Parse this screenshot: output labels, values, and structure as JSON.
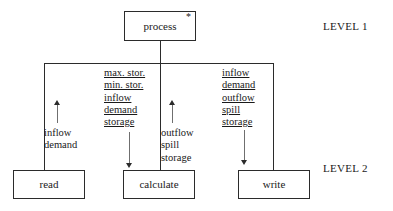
{
  "diagram": {
    "levels": [
      {
        "id": "level-1",
        "label": "LEVEL 1"
      },
      {
        "id": "level-2",
        "label": "LEVEL 2"
      }
    ],
    "modules": {
      "process": {
        "label": "process",
        "annotation": "*"
      },
      "read": {
        "label": "read"
      },
      "calculate": {
        "label": "calculate"
      },
      "write": {
        "label": "write"
      }
    },
    "flows": {
      "read_to_process": {
        "direction": "up",
        "underlined": false,
        "items": [
          "inflow",
          "demand"
        ]
      },
      "process_to_calculate": {
        "direction": "down",
        "underlined": true,
        "items": [
          "max. stor.",
          "min. stor.",
          "inflow",
          "demand",
          "storage"
        ]
      },
      "calculate_to_process": {
        "direction": "up",
        "underlined": false,
        "items": [
          "outflow",
          "spill",
          "storage"
        ]
      },
      "process_to_write": {
        "direction": "down",
        "underlined": true,
        "items": [
          "inflow",
          "demand",
          "outflow",
          "spill",
          "storage"
        ]
      }
    }
  },
  "colors": {
    "line": "#2b2b2b",
    "flow_line": "#6f6f6f",
    "background": "#ffffff",
    "text": "#1a1a1a"
  }
}
